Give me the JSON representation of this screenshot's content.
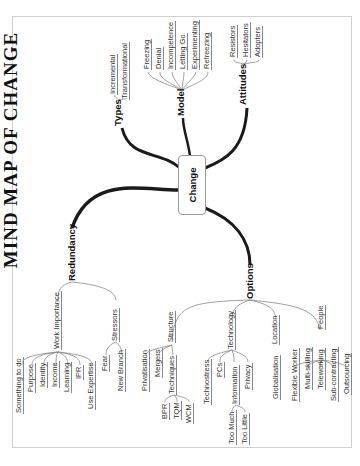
{
  "title": "MIND MAP OF CHANGE",
  "center": {
    "label": "Change"
  },
  "branches": {
    "types": {
      "label": "Types",
      "children": [
        "Incremental",
        "Transformational"
      ]
    },
    "model": {
      "label": "Model",
      "children": [
        "Freezing",
        "Denial",
        "Incompetence",
        "Letting Go",
        "Experimenting",
        "Refreezing"
      ]
    },
    "attitudes": {
      "label": "Attitudes",
      "children": [
        "Resistors",
        "Hesitators",
        "Adopters"
      ]
    },
    "redundancy": {
      "label": "Redundancy",
      "work_importance": {
        "label": "Work Importance",
        "children": [
          "Something to do",
          "Purpose",
          "Identity",
          "Income",
          "Learning",
          "IPR",
          "Use Expertise"
        ]
      },
      "stressors": {
        "label": "Stressors",
        "children": [
          "Fear",
          "New Branch"
        ]
      }
    },
    "options": {
      "label": "Options",
      "structure": {
        "label": "Structure",
        "children": [
          "Privatisation",
          "Mergers"
        ],
        "techniques": {
          "label": "Techniques",
          "children": [
            "BPR",
            "TQM",
            "WCM"
          ]
        }
      },
      "technology": {
        "label": "Technology",
        "children": [
          "Technostress",
          "PCs",
          "Privacy"
        ],
        "information": {
          "label": "Information",
          "children": [
            "Too Much",
            "Too Little"
          ]
        }
      },
      "location": {
        "label": "Location",
        "children": [
          "Globalisation"
        ]
      },
      "people": {
        "label": "People",
        "children": [
          "Flexible Worker",
          "Multi-skilling",
          "Teleworking",
          "Sub-contracting",
          "Outsourcing"
        ]
      }
    }
  },
  "colors": {
    "line": "#1a1a1a",
    "thin_line": "#888888",
    "frame": "#cfcfcf"
  }
}
